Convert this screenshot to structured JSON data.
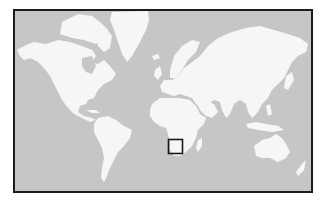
{
  "map": {
    "type": "world-locator-map",
    "projection": "Mercator",
    "colors": {
      "ocean": "#c6c6c6",
      "land": "#f6f6f6",
      "frame": "#1c1c1c",
      "marker": "#1a1a1a"
    },
    "continents": [
      "North America",
      "Greenland",
      "South America",
      "Europe",
      "Asia",
      "Africa",
      "Madagascar",
      "Australia"
    ],
    "highlight": {
      "shape": "square",
      "region": "Southern Africa (Namibia / South Africa area)",
      "label": ""
    }
  }
}
